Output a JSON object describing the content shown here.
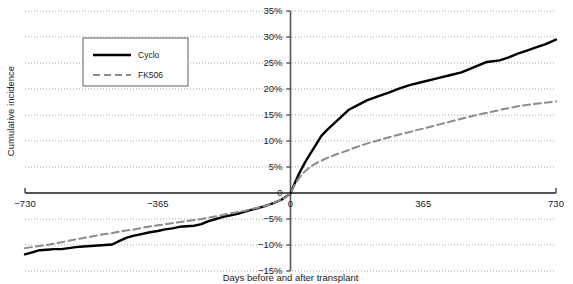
{
  "chart_data": {
    "type": "line",
    "title": "",
    "xlabel": "Days before and after transplant",
    "ylabel": "Cumulative incidence",
    "xlim": [
      -730,
      730
    ],
    "ylim": [
      -15,
      35
    ],
    "xticks": [
      -730,
      -365,
      0,
      365,
      730
    ],
    "xtick_labels": [
      "−730",
      "−365",
      "0",
      "365",
      "730"
    ],
    "yticks": [
      35,
      30,
      25,
      20,
      15,
      10,
      5,
      0,
      -5,
      -10,
      -15
    ],
    "ytick_labels": [
      "35%",
      "30%",
      "25%",
      "20%",
      "15%",
      "10%",
      "5%",
      "0",
      "−5%",
      "−10%",
      "−15%"
    ],
    "grid": true,
    "grid_style": "dotted",
    "legend_position": "upper-left",
    "series": [
      {
        "name": "Cyclo",
        "color": "#000000",
        "style": "solid",
        "width": 2.4,
        "x": [
          -730,
          -710,
          -690,
          -670,
          -650,
          -630,
          -610,
          -590,
          -570,
          -550,
          -530,
          -510,
          -490,
          -470,
          -450,
          -430,
          -410,
          -390,
          -365,
          -345,
          -325,
          -305,
          -285,
          -265,
          -245,
          -225,
          -205,
          -185,
          -165,
          -145,
          -125,
          -105,
          -85,
          -65,
          -45,
          -25,
          -10,
          0,
          10,
          20,
          30,
          40,
          55,
          70,
          85,
          100,
          120,
          140,
          160,
          185,
          210,
          240,
          270,
          300,
          330,
          365,
          400,
          435,
          470,
          505,
          540,
          575,
          600,
          625,
          650,
          675,
          700,
          730
        ],
        "y": [
          -11.8,
          -11.4,
          -11.0,
          -10.9,
          -10.8,
          -10.8,
          -10.6,
          -10.4,
          -10.3,
          -10.2,
          -10.1,
          -10.0,
          -9.9,
          -9.2,
          -8.6,
          -8.2,
          -7.9,
          -7.6,
          -7.3,
          -7.0,
          -6.8,
          -6.5,
          -6.4,
          -6.3,
          -6.0,
          -5.4,
          -5.0,
          -4.6,
          -4.3,
          -4.0,
          -3.6,
          -3.2,
          -2.8,
          -2.4,
          -1.9,
          -1.3,
          -0.6,
          0.0,
          1.6,
          3.2,
          4.6,
          5.9,
          7.6,
          9.3,
          11.0,
          12.1,
          13.4,
          14.7,
          16.0,
          16.9,
          17.8,
          18.6,
          19.3,
          20.1,
          20.8,
          21.4,
          22.0,
          22.6,
          23.2,
          24.2,
          25.2,
          25.5,
          26.1,
          26.8,
          27.4,
          28.0,
          28.6,
          29.5
        ]
      },
      {
        "name": "FK506",
        "color": "#8c8c8c",
        "style": "dashed",
        "width": 2.0,
        "x": [
          -730,
          -700,
          -670,
          -640,
          -610,
          -580,
          -550,
          -520,
          -490,
          -460,
          -430,
          -400,
          -365,
          -335,
          -305,
          -275,
          -245,
          -215,
          -185,
          -155,
          -125,
          -95,
          -65,
          -35,
          -15,
          0,
          12,
          25,
          40,
          58,
          78,
          100,
          125,
          150,
          180,
          210,
          245,
          280,
          320,
          365,
          410,
          455,
          500,
          545,
          590,
          635,
          680,
          730
        ],
        "y": [
          -10.6,
          -10.3,
          -10.0,
          -9.6,
          -9.2,
          -8.8,
          -8.4,
          -8.0,
          -7.7,
          -7.3,
          -7.0,
          -6.6,
          -6.2,
          -5.9,
          -5.6,
          -5.3,
          -5.0,
          -4.6,
          -4.2,
          -3.8,
          -3.4,
          -2.9,
          -2.4,
          -1.6,
          -0.9,
          0.0,
          1.6,
          3.0,
          4.2,
          5.2,
          6.0,
          6.7,
          7.4,
          8.0,
          8.8,
          9.5,
          10.2,
          10.9,
          11.6,
          12.4,
          13.2,
          14.0,
          14.8,
          15.5,
          16.2,
          16.8,
          17.2,
          17.6
        ]
      }
    ]
  },
  "legend": {
    "items": [
      {
        "label": "Cyclo",
        "style": "solid"
      },
      {
        "label": "FK506",
        "style": "dashed"
      }
    ]
  },
  "axes": {
    "y_title": "Cumulative incidence",
    "x_title": "Days before and after transplant"
  }
}
